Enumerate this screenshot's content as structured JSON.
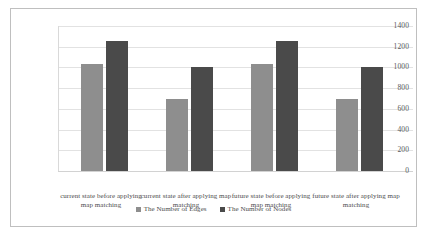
{
  "chart_data": {
    "type": "bar",
    "title": "",
    "xlabel": "",
    "ylabel": "",
    "ylim": [
      0,
      1400
    ],
    "grid": true,
    "legend_position": "bottom",
    "categories": [
      "current state before applying map matching",
      "current state after applying map matching",
      "future state before applying map matching",
      "future state after applying map matching"
    ],
    "y_ticks": [
      "0",
      "200",
      "400",
      "600",
      "800",
      "1000",
      "1200",
      "1400"
    ],
    "y_tick_values": [
      0,
      200,
      400,
      600,
      800,
      1000,
      1200,
      1400
    ],
    "series": [
      {
        "name": "The Number of Edges",
        "color": "#8e8e8e",
        "values": [
          1030,
          700,
          1030,
          700
        ]
      },
      {
        "name": "The Number of Nodes",
        "color": "#4a4a4a",
        "values": [
          1255,
          1000,
          1255,
          1000
        ]
      }
    ]
  },
  "legend": {
    "entries": [
      {
        "label": "The Number of Edges",
        "marker": "square-marker-light"
      },
      {
        "label": "The Number of Nodes",
        "marker": "square-marker-dark"
      }
    ]
  },
  "colors": {
    "series_edges": "#8e8e8e",
    "series_nodes": "#4a4a4a",
    "gridline": "#e2e2e2",
    "frame_border": "#bfbfbf",
    "tick_text": "#59595b"
  }
}
